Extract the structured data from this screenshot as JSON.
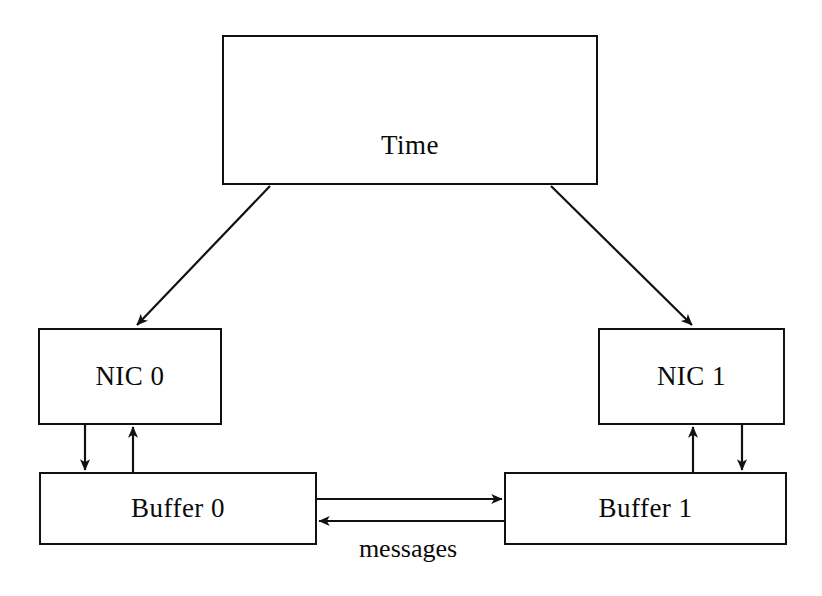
{
  "diagram": {
    "background_color": "#ffffff",
    "stroke_color": "#111111",
    "text_color": "#0a0a0a",
    "nodes": [
      {
        "id": "time",
        "label": "Time",
        "x": 222,
        "y": 35,
        "w": 376,
        "h": 150
      },
      {
        "id": "nic0",
        "label": "NIC 0",
        "x": 38,
        "y": 328,
        "w": 184,
        "h": 97
      },
      {
        "id": "nic1",
        "label": "NIC 1",
        "x": 598,
        "y": 328,
        "w": 187,
        "h": 97
      },
      {
        "id": "buffer0",
        "label": "Buffer 0",
        "x": 39,
        "y": 472,
        "w": 278,
        "h": 73
      },
      {
        "id": "buffer1",
        "label": "Buffer 1",
        "x": 504,
        "y": 472,
        "w": 283,
        "h": 73
      }
    ],
    "edges": [
      {
        "id": "time-to-nic0",
        "from": "time",
        "to": "nic0",
        "style": "diagonal-arrow",
        "label": ""
      },
      {
        "id": "time-to-nic1",
        "from": "time",
        "to": "nic1",
        "style": "diagonal-arrow",
        "label": ""
      },
      {
        "id": "nic0-to-buffer0",
        "from": "nic0",
        "to": "buffer0",
        "style": "vertical-arrow-down",
        "label": ""
      },
      {
        "id": "buffer0-to-nic0",
        "from": "buffer0",
        "to": "nic0",
        "style": "vertical-arrow-up",
        "label": ""
      },
      {
        "id": "nic1-to-buffer1",
        "from": "nic1",
        "to": "buffer1",
        "style": "vertical-arrow-down",
        "label": ""
      },
      {
        "id": "buffer1-to-nic1",
        "from": "buffer1",
        "to": "nic1",
        "style": "vertical-arrow-up",
        "label": ""
      },
      {
        "id": "buffer0-to-buffer1",
        "from": "buffer0",
        "to": "buffer1",
        "style": "horizontal-arrow-right",
        "label": "messages"
      },
      {
        "id": "buffer1-to-buffer0",
        "from": "buffer1",
        "to": "buffer0",
        "style": "horizontal-arrow-left",
        "label": "messages"
      }
    ],
    "labels": {
      "time": "Time",
      "nic0": "NIC 0",
      "nic1": "NIC 1",
      "buffer0": "Buffer 0",
      "buffer1": "Buffer 1",
      "messages": "messages"
    }
  }
}
